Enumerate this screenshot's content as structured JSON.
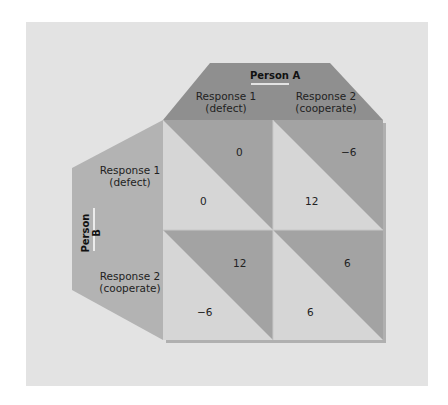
{
  "diagram": {
    "type": "payoff-matrix",
    "person_a": {
      "title": "Person A",
      "responses": [
        {
          "line1": "Response 1",
          "line2": "(defect)"
        },
        {
          "line1": "Response 2",
          "line2": "(cooperate)"
        }
      ]
    },
    "person_b": {
      "title": "Person B",
      "responses": [
        {
          "line1": "Response 1",
          "line2": "(defect)"
        },
        {
          "line1": "Response 2",
          "line2": "(cooperate)"
        }
      ]
    },
    "cells": [
      {
        "row": 0,
        "col": 0,
        "payoff_a": "0",
        "payoff_b": "0"
      },
      {
        "row": 0,
        "col": 1,
        "payoff_a": "−6",
        "payoff_b": "12"
      },
      {
        "row": 1,
        "col": 0,
        "payoff_a": "12",
        "payoff_b": "−6"
      },
      {
        "row": 1,
        "col": 1,
        "payoff_a": "6",
        "payoff_b": "6"
      }
    ],
    "colors": {
      "background": "#e3e3e3",
      "header_dark": "#8f8f8f",
      "header_left": "#b3b3b3",
      "cell_dark": "#a3a3a3",
      "cell_light": "#d6d6d6"
    }
  }
}
